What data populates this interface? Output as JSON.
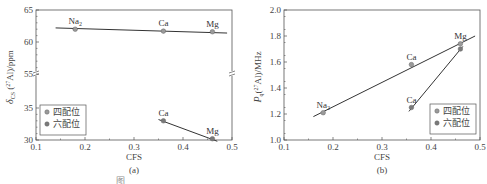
{
  "chart_data": [
    {
      "type": "scatter",
      "panel": "(a)",
      "xlabel": "CFS",
      "ylabel": "δCS (27Al)/ppm",
      "ylabel_parts": {
        "main": "δ",
        "sub": "CS",
        "paren_open": " (",
        "sup": "27",
        "rest": "Al)/ppm"
      },
      "xlim": [
        0.1,
        0.5
      ],
      "ylim": [
        30,
        65
      ],
      "y_axis_break": [
        35,
        55
      ],
      "xticks": [
        "0.1",
        "0.2",
        "0.3",
        "0.4",
        "0.5"
      ],
      "yticks": [
        "65",
        "60",
        "55",
        "35",
        "30"
      ],
      "legend": [
        "四配位",
        "六配位"
      ],
      "legend_position": "lower left",
      "series": [
        {
          "name": "四配位",
          "points": [
            {
              "x": 0.18,
              "y": 62.0,
              "label": "Na2"
            },
            {
              "x": 0.36,
              "y": 61.7,
              "label": "Ca"
            },
            {
              "x": 0.46,
              "y": 61.6,
              "label": "Mg"
            }
          ],
          "fit_line": {
            "x": [
              0.14,
              0.49
            ],
            "y": [
              62.2,
              61.4
            ]
          }
        },
        {
          "name": "六配位",
          "points": [
            {
              "x": 0.36,
              "y": 33.0,
              "label": "Ca"
            },
            {
              "x": 0.46,
              "y": 30.2,
              "label": "Mg"
            }
          ],
          "fit_line": {
            "x": [
              0.35,
              0.47
            ],
            "y": [
              33.2,
              29.8
            ]
          }
        }
      ]
    },
    {
      "type": "scatter",
      "panel": "(b)",
      "xlabel": "CFS",
      "ylabel": "Pq(27Al)/MHz",
      "ylabel_parts": {
        "main": "P",
        "sub": "q",
        "paren_open": "(",
        "sup": "27",
        "rest": "Al)/MHz"
      },
      "xlim": [
        0.1,
        0.5
      ],
      "ylim": [
        1.0,
        2.0
      ],
      "xticks": [
        "0.1",
        "0.2",
        "0.3",
        "0.4",
        "0.5"
      ],
      "yticks": [
        "2.0",
        "1.8",
        "1.6",
        "1.4",
        "1.2",
        "1.0"
      ],
      "legend": [
        "四配位",
        "六配位"
      ],
      "legend_position": "lower right",
      "series": [
        {
          "name": "四配位",
          "points": [
            {
              "x": 0.18,
              "y": 1.21,
              "label": "Na2"
            },
            {
              "x": 0.36,
              "y": 1.58,
              "label": "Ca"
            },
            {
              "x": 0.46,
              "y": 1.74,
              "label": "Mg"
            }
          ],
          "fit_line": {
            "x": [
              0.16,
              0.49
            ],
            "y": [
              1.18,
              1.8
            ]
          }
        },
        {
          "name": "六配位",
          "points": [
            {
              "x": 0.36,
              "y": 1.25,
              "label": "Ca"
            },
            {
              "x": 0.46,
              "y": 1.7,
              "label": ""
            }
          ],
          "fit_line": {
            "x": [
              0.355,
              0.465
            ],
            "y": [
              1.22,
              1.72
            ]
          }
        }
      ]
    }
  ],
  "captions": {
    "a": "(a)",
    "b": "(b)",
    "figure_prefix": "图"
  },
  "colors": {
    "axis": "#555555",
    "line": "#333333",
    "marker_four": "#9a9a9a",
    "marker_six": "#7a7a7a"
  }
}
